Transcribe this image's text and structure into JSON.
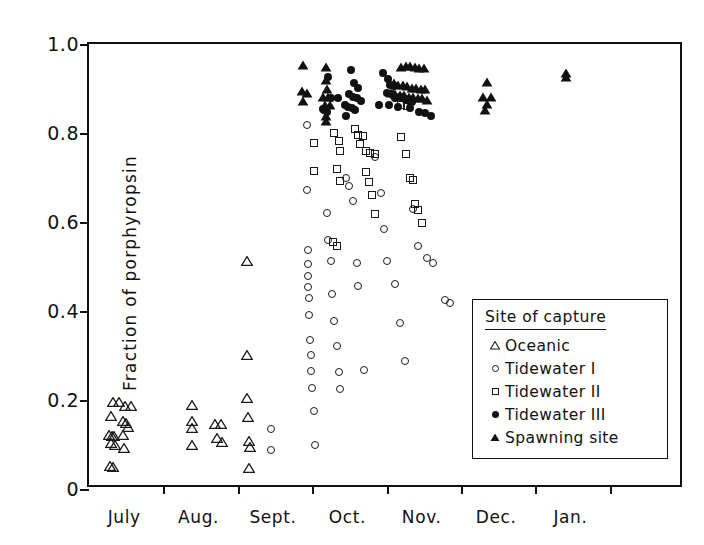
{
  "chart_data": {
    "type": "scatter",
    "title": "",
    "xlabel": "",
    "ylabel": "Fraction  of  porphyropsin",
    "xlim": [
      0,
      8
    ],
    "ylim": [
      0,
      1.0
    ],
    "grid": false,
    "legend_position": "inside-lower-right",
    "x_tick_labels": [
      "July",
      "Aug.",
      "Sept.",
      "Oct.",
      "Nov.",
      "Dec.",
      "Jan."
    ],
    "x_tick_positions": [
      0.5,
      1.5,
      2.5,
      3.5,
      4.5,
      5.5,
      6.5
    ],
    "x_boundary_ticks": [
      0,
      1,
      2,
      3,
      4,
      5,
      6,
      7,
      8
    ],
    "y_tick_labels": [
      "0",
      "0.2",
      "0.4",
      "0.6",
      "0.8",
      "1.0"
    ],
    "y_tick_values": [
      0,
      0.2,
      0.4,
      0.6,
      0.8,
      1.0
    ],
    "legend": {
      "title": "Site of capture",
      "entries": [
        {
          "label": "Oceanic",
          "marker": "open-triangle"
        },
        {
          "label": "Tidewater I",
          "marker": "open-circle"
        },
        {
          "label": "Tidewater II",
          "marker": "open-square"
        },
        {
          "label": "Tidewater III",
          "marker": "filled-circle"
        },
        {
          "label": "Spawning site",
          "marker": "filled-triangle"
        }
      ]
    },
    "series": [
      {
        "name": "Oceanic",
        "marker": "open-triangle",
        "points": [
          [
            0.32,
            0.195
          ],
          [
            0.4,
            0.196
          ],
          [
            0.49,
            0.186
          ],
          [
            0.56,
            0.187
          ],
          [
            0.3,
            0.165
          ],
          [
            0.46,
            0.152
          ],
          [
            0.5,
            0.148
          ],
          [
            0.52,
            0.14
          ],
          [
            0.27,
            0.122
          ],
          [
            0.31,
            0.12
          ],
          [
            0.34,
            0.118
          ],
          [
            0.46,
            0.122
          ],
          [
            0.3,
            0.103
          ],
          [
            0.355,
            0.098
          ],
          [
            0.47,
            0.093
          ],
          [
            0.28,
            0.052
          ],
          [
            0.325,
            0.05
          ],
          [
            1.38,
            0.188
          ],
          [
            1.38,
            0.152
          ],
          [
            1.38,
            0.136
          ],
          [
            1.38,
            0.098
          ],
          [
            1.7,
            0.145
          ],
          [
            1.77,
            0.146
          ],
          [
            1.72,
            0.115
          ],
          [
            1.79,
            0.106
          ],
          [
            2.12,
            0.512
          ],
          [
            2.12,
            0.302
          ],
          [
            2.12,
            0.205
          ],
          [
            2.14,
            0.162
          ],
          [
            2.15,
            0.108
          ],
          [
            2.17,
            0.095
          ],
          [
            2.15,
            0.048
          ]
        ]
      },
      {
        "name": "Tidewater I",
        "marker": "open-circle",
        "points": [
          [
            2.45,
            0.135
          ],
          [
            2.45,
            0.088
          ],
          [
            2.93,
            0.818
          ],
          [
            2.93,
            0.672
          ],
          [
            2.95,
            0.538
          ],
          [
            2.95,
            0.505
          ],
          [
            2.95,
            0.478
          ],
          [
            2.95,
            0.455
          ],
          [
            2.96,
            0.43
          ],
          [
            2.96,
            0.392
          ],
          [
            2.97,
            0.335
          ],
          [
            2.98,
            0.302
          ],
          [
            2.99,
            0.265
          ],
          [
            3.0,
            0.228
          ],
          [
            3.02,
            0.175
          ],
          [
            3.04,
            0.098
          ],
          [
            3.2,
            0.62
          ],
          [
            3.22,
            0.56
          ],
          [
            3.25,
            0.512
          ],
          [
            3.27,
            0.438
          ],
          [
            3.3,
            0.378
          ],
          [
            3.33,
            0.322
          ],
          [
            3.36,
            0.262
          ],
          [
            3.38,
            0.225
          ],
          [
            3.45,
            0.7
          ],
          [
            3.5,
            0.682
          ],
          [
            3.55,
            0.648
          ],
          [
            3.6,
            0.508
          ],
          [
            3.62,
            0.456
          ],
          [
            3.7,
            0.268
          ],
          [
            3.85,
            0.745
          ],
          [
            3.92,
            0.665
          ],
          [
            3.96,
            0.585
          ],
          [
            4.0,
            0.512
          ],
          [
            4.12,
            0.46
          ],
          [
            4.18,
            0.372
          ],
          [
            4.25,
            0.287
          ],
          [
            4.35,
            0.63
          ],
          [
            4.42,
            0.545
          ],
          [
            4.55,
            0.52
          ],
          [
            4.62,
            0.508
          ],
          [
            4.78,
            0.425
          ],
          [
            4.85,
            0.418
          ]
        ]
      },
      {
        "name": "Tidewater II",
        "marker": "open-square",
        "points": [
          [
            3.03,
            0.778
          ],
          [
            3.03,
            0.715
          ],
          [
            3.3,
            0.8
          ],
          [
            3.36,
            0.782
          ],
          [
            3.38,
            0.76
          ],
          [
            3.33,
            0.718
          ],
          [
            3.38,
            0.692
          ],
          [
            3.28,
            0.556
          ],
          [
            3.33,
            0.545
          ],
          [
            3.58,
            0.81
          ],
          [
            3.62,
            0.795
          ],
          [
            3.68,
            0.793
          ],
          [
            3.65,
            0.775
          ],
          [
            3.72,
            0.76
          ],
          [
            3.78,
            0.755
          ],
          [
            3.84,
            0.752
          ],
          [
            3.72,
            0.712
          ],
          [
            3.76,
            0.69
          ],
          [
            3.8,
            0.66
          ],
          [
            3.85,
            0.618
          ],
          [
            4.2,
            0.79
          ],
          [
            4.26,
            0.752
          ],
          [
            4.32,
            0.7
          ],
          [
            4.35,
            0.695
          ],
          [
            4.38,
            0.64
          ],
          [
            4.42,
            0.628
          ],
          [
            4.48,
            0.598
          ],
          [
            4.2,
            0.862
          ],
          [
            4.28,
            0.86
          ]
        ]
      },
      {
        "name": "Tidewater III",
        "marker": "filled-circle",
        "points": [
          [
            3.22,
            0.925
          ],
          [
            3.26,
            0.878
          ],
          [
            3.35,
            0.878
          ],
          [
            3.14,
            0.855
          ],
          [
            3.16,
            0.852
          ],
          [
            3.2,
            0.848
          ],
          [
            3.52,
            0.942
          ],
          [
            3.56,
            0.912
          ],
          [
            3.62,
            0.902
          ],
          [
            3.5,
            0.888
          ],
          [
            3.55,
            0.88
          ],
          [
            3.6,
            0.878
          ],
          [
            3.66,
            0.872
          ],
          [
            3.44,
            0.862
          ],
          [
            3.48,
            0.858
          ],
          [
            3.54,
            0.856
          ],
          [
            3.58,
            0.852
          ],
          [
            3.46,
            0.838
          ],
          [
            3.95,
            0.935
          ],
          [
            4.02,
            0.922
          ],
          [
            4.05,
            0.908
          ],
          [
            4.1,
            0.905
          ],
          [
            4.0,
            0.89
          ],
          [
            4.08,
            0.888
          ],
          [
            4.12,
            0.878
          ],
          [
            4.18,
            0.88
          ],
          [
            4.22,
            0.878
          ],
          [
            4.26,
            0.875
          ],
          [
            4.3,
            0.872
          ],
          [
            4.34,
            0.87
          ],
          [
            3.9,
            0.862
          ],
          [
            4.04,
            0.862
          ],
          [
            4.16,
            0.858
          ],
          [
            4.32,
            0.856
          ],
          [
            4.44,
            0.848
          ],
          [
            4.52,
            0.845
          ],
          [
            4.6,
            0.838
          ]
        ]
      },
      {
        "name": "Spawning site",
        "marker": "filled-triangle",
        "points": [
          [
            2.88,
            0.952
          ],
          [
            2.86,
            0.895
          ],
          [
            2.93,
            0.89
          ],
          [
            2.88,
            0.872
          ],
          [
            3.18,
            0.948
          ],
          [
            3.18,
            0.92
          ],
          [
            3.2,
            0.9
          ],
          [
            3.15,
            0.882
          ],
          [
            3.22,
            0.88
          ],
          [
            3.17,
            0.862
          ],
          [
            3.24,
            0.862
          ],
          [
            3.18,
            0.838
          ],
          [
            3.18,
            0.826
          ],
          [
            4.2,
            0.948
          ],
          [
            4.26,
            0.95
          ],
          [
            4.32,
            0.95
          ],
          [
            4.38,
            0.948
          ],
          [
            4.44,
            0.946
          ],
          [
            4.5,
            0.946
          ],
          [
            4.1,
            0.912
          ],
          [
            4.16,
            0.908
          ],
          [
            4.22,
            0.908
          ],
          [
            4.28,
            0.905
          ],
          [
            4.34,
            0.902
          ],
          [
            4.4,
            0.902
          ],
          [
            4.46,
            0.9
          ],
          [
            4.52,
            0.898
          ],
          [
            4.06,
            0.89
          ],
          [
            4.12,
            0.888
          ],
          [
            4.18,
            0.885
          ],
          [
            4.24,
            0.885
          ],
          [
            4.3,
            0.882
          ],
          [
            4.36,
            0.88
          ],
          [
            4.42,
            0.878
          ],
          [
            4.48,
            0.878
          ],
          [
            4.54,
            0.875
          ],
          [
            5.35,
            0.915
          ],
          [
            5.3,
            0.882
          ],
          [
            5.4,
            0.88
          ],
          [
            5.35,
            0.866
          ],
          [
            5.33,
            0.852
          ],
          [
            6.42,
            0.935
          ],
          [
            6.42,
            0.925
          ]
        ]
      }
    ]
  }
}
